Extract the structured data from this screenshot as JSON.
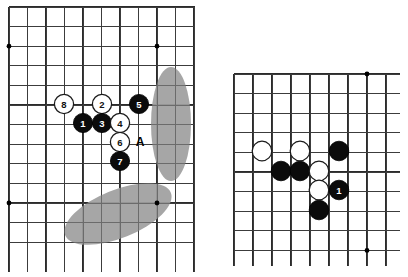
{
  "figure": {
    "type": "go-board-diagram",
    "panel_count": 2,
    "colors": {
      "background": "#ffffff",
      "grid_line": "#2b2b2b",
      "black_stone": "#0b0b0b",
      "white_stone": "#ffffff",
      "stone_outline": "#1a1a1a",
      "zone_highlight": "#9e9e9e",
      "label_on_black": "#ffffff",
      "label_on_white": "#111111"
    }
  },
  "left_board": {
    "name": "left-go-board",
    "grid": {
      "pitch_x": 18.5,
      "pitch_y": 19.6,
      "origin_x": 9,
      "origin_y": 7,
      "cols": 11,
      "rows": 13
    },
    "star_points": [
      {
        "col": 0,
        "row": 2
      },
      {
        "col": 8,
        "row": 2
      },
      {
        "col": 0,
        "row": 10
      },
      {
        "col": 8,
        "row": 10
      }
    ],
    "zones": [
      {
        "name": "zone-right-vertical",
        "cx": 171,
        "cy": 124,
        "rx": 20,
        "ry": 57,
        "rotate": 0
      },
      {
        "name": "zone-lower-diagonal",
        "cx": 118,
        "cy": 214,
        "rx": 57,
        "ry": 24,
        "rotate": -22
      }
    ],
    "stones": [
      {
        "name": "stone-8-white",
        "color": "white",
        "label": "8",
        "cx": 64,
        "cy": 104
      },
      {
        "name": "stone-2-white",
        "color": "white",
        "label": "2",
        "cx": 102,
        "cy": 104
      },
      {
        "name": "stone-5-black",
        "color": "black",
        "label": "5",
        "cx": 139,
        "cy": 104
      },
      {
        "name": "stone-1-black",
        "color": "black",
        "label": "1",
        "cx": 83,
        "cy": 123
      },
      {
        "name": "stone-3-black",
        "color": "black",
        "label": "3",
        "cx": 102,
        "cy": 123
      },
      {
        "name": "stone-4-white",
        "color": "white",
        "label": "4",
        "cx": 120,
        "cy": 123
      },
      {
        "name": "stone-6-white",
        "color": "white",
        "label": "6",
        "cx": 120,
        "cy": 142
      },
      {
        "name": "stone-7-black",
        "color": "black",
        "label": "7",
        "cx": 120,
        "cy": 161
      }
    ],
    "point_labels": [
      {
        "name": "point-label-a",
        "text": "A",
        "cx": 140,
        "cy": 142
      }
    ],
    "stone_radius": 9.6
  },
  "right_board": {
    "name": "right-go-board",
    "grid": {
      "pitch_x": 19.0,
      "pitch_y": 19.6,
      "origin_x": 234,
      "origin_y": 74,
      "cols": 9,
      "rows": 10
    },
    "star_points": [
      {
        "col": 7,
        "row": 0
      },
      {
        "col": 7,
        "row": 9
      }
    ],
    "zones": [],
    "stones": [
      {
        "name": "stone-white-left",
        "color": "white",
        "label": "",
        "cx": 262,
        "cy": 151
      },
      {
        "name": "stone-white-upper",
        "color": "white",
        "label": "",
        "cx": 300,
        "cy": 151
      },
      {
        "name": "stone-black-upper-right",
        "color": "black",
        "label": "",
        "cx": 339,
        "cy": 151
      },
      {
        "name": "stone-black-mid-left",
        "color": "black",
        "label": "",
        "cx": 281,
        "cy": 171
      },
      {
        "name": "stone-black-mid",
        "color": "black",
        "label": "",
        "cx": 300,
        "cy": 171
      },
      {
        "name": "stone-white-mid-right",
        "color": "white",
        "label": "",
        "cx": 319,
        "cy": 171
      },
      {
        "name": "stone-white-lower",
        "color": "white",
        "label": "",
        "cx": 319,
        "cy": 190
      },
      {
        "name": "stone-1-black",
        "color": "black",
        "label": "1",
        "cx": 339,
        "cy": 190
      },
      {
        "name": "stone-black-bottom",
        "color": "black",
        "label": "",
        "cx": 319,
        "cy": 210
      }
    ],
    "stone_radius": 9.8
  }
}
